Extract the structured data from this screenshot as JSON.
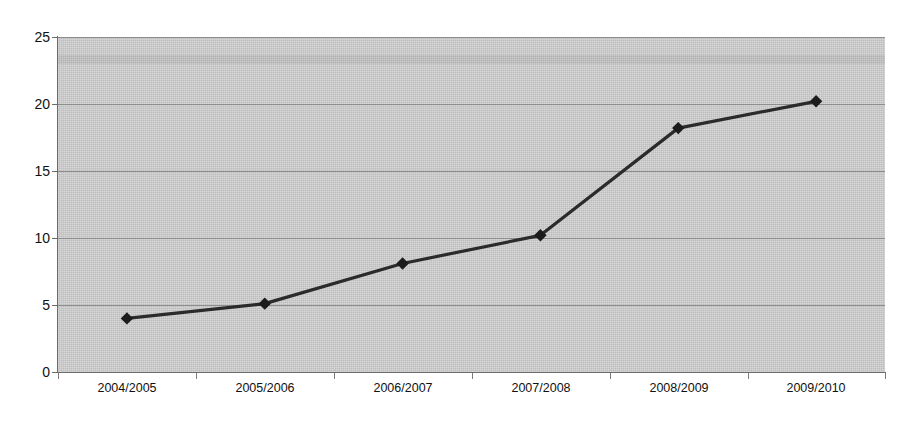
{
  "chart_data": {
    "type": "line",
    "title": "",
    "subtitle": "",
    "xlabel": "",
    "ylabel": "",
    "categories": [
      "2004/2005",
      "2005/2006",
      "2006/2007",
      "2007/2008",
      "2008/2009",
      "2009/2010"
    ],
    "series": [
      {
        "name": "Series 1",
        "values": [
          4.0,
          5.1,
          8.1,
          10.2,
          18.2,
          20.2
        ],
        "line_color": "#2b2b2b",
        "marker": "diamond",
        "marker_color": "#1c1c1c"
      }
    ],
    "ylim": [
      0,
      25
    ],
    "yticks": [
      0,
      5,
      10,
      15,
      20,
      25
    ],
    "ytick_labels": [
      "0",
      "5",
      "10",
      "15",
      "20",
      "25"
    ],
    "grid": true,
    "grid_axis": "y",
    "legend": false,
    "legend_position": "none",
    "plot_background_color": "#bdbdbd",
    "page_background_color": "#ffffff",
    "gridline_color": "#8e8e8e",
    "axis_color": "#6b6b6b",
    "text_color": "#111111"
  }
}
